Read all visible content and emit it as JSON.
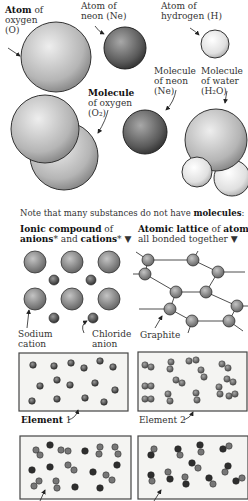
{
  "labels": {
    "atom_oxygen": {
      "bold": "Atom",
      "rest": " of",
      "line2": "oxygen",
      "line3": "(O)"
    },
    "atom_neon": {
      "line1": "Atom of",
      "line2": "neon (Ne)"
    },
    "atom_hydrogen": {
      "line1": "Atom of",
      "line2": "hydrogen (H)"
    },
    "molecule_oxygen": {
      "bold": "Molecule",
      "line2": "of oxygen",
      "line3": "(O₂)"
    },
    "molecule_neon": {
      "line1": "Molecule",
      "line2": "of neon",
      "line3": "(Ne)"
    },
    "molecule_water": {
      "line1": "Molecule",
      "line2": "of water",
      "line3": "(H₂O)"
    },
    "note": {
      "text": "Note that many substances do not have ",
      "bold": "molecules",
      "end": ":"
    },
    "ionic": {
      "bold1": "Ionic compound",
      "rest1": " of",
      "bold2": "anions",
      "mid": "* and ",
      "bold3": "cations",
      "end": "* ▼"
    },
    "lattice": {
      "bold1": "Atomic lattice",
      "rest1": " of ",
      "bold2": "atoms",
      "line2": "all bonded together ▼"
    },
    "sodium": {
      "line1": "Sodium",
      "line2": "cation"
    },
    "chloride": {
      "line1": "Chloride",
      "line2": "anion"
    },
    "graphite": "Graphite",
    "element1": {
      "bold": "Element",
      "rest": " 1"
    },
    "element2": "Element 2"
  },
  "colors": {
    "oxygen_light": "#e6e6e6",
    "oxygen_dark": "#8a8a8a",
    "neon_light": "#9a9a9a",
    "neon_dark": "#3a3a3a",
    "hydrogen_light": "#ffffff",
    "hydrogen_dark": "#bcbcbc",
    "box_bg": "#f4f4f2"
  }
}
